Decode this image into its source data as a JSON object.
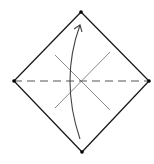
{
  "diagram": {
    "type": "origami-fold-step",
    "colors": {
      "background": "#ffffff",
      "outline": "#1a1a1a",
      "crease": "#888888",
      "dashed": "#555555",
      "arrow": "#444444",
      "vertex": "#000000"
    },
    "square": {
      "top": [
        81,
        12
      ],
      "right": [
        149,
        81
      ],
      "bottom": [
        82,
        152
      ],
      "left": [
        14,
        81
      ]
    },
    "valley_fold_line": {
      "from": [
        14,
        81
      ],
      "to": [
        149,
        81
      ],
      "style": "dashed"
    },
    "creases": [
      {
        "from": [
          55,
          55
        ],
        "to": [
          110,
          110
        ]
      },
      {
        "from": [
          110,
          52
        ],
        "to": [
          55,
          108
        ]
      }
    ],
    "fold_arrow": {
      "from": [
        80,
        139
      ],
      "control": [
        60,
        80
      ],
      "to": [
        80,
        25
      ],
      "direction": "up"
    }
  }
}
